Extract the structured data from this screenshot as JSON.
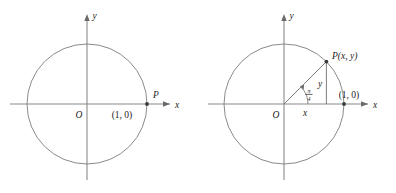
{
  "figure": {
    "panels": [
      {
        "id": "left",
        "axis_x_label": "x",
        "axis_y_label": "y",
        "origin_label": "O",
        "point_label": "P",
        "point_coord_label": "(1, 0)",
        "circle_radius_label": "1",
        "point_angle_deg": 0
      },
      {
        "id": "right",
        "axis_x_label": "x",
        "axis_y_label": "y",
        "origin_label": "O",
        "point_label": "P(x, y)",
        "point_coord_label": "(1, 0)",
        "angle_numerator": "π",
        "angle_denominator": "4",
        "leg_horizontal_label": "x",
        "leg_vertical_label": "y",
        "point_angle_deg": 45
      }
    ],
    "colors": {
      "background": "#ffffff",
      "axis": "#8a8a8a",
      "curve": "#7d7d7d",
      "construction": "#6f6f6f",
      "text": "#1c1c1c",
      "point_marker": "#3a3a3a"
    }
  }
}
